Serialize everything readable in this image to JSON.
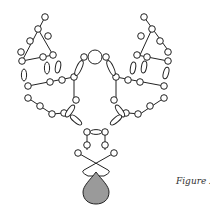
{
  "figure": {
    "caption": "Figure 2",
    "colors": {
      "stroke": "#222222",
      "bead_fill": "#ffffff",
      "drop_fill": "#9a9a9a",
      "background": "#ffffff"
    }
  }
}
